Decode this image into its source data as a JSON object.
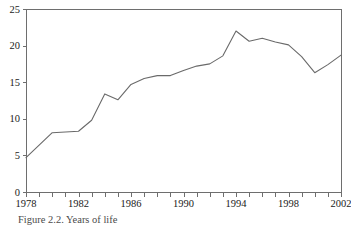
{
  "figure": {
    "caption": "Figure 2.2.  Years of life",
    "background_color": "#ffffff",
    "line_color": "#6a6a6a",
    "axis_color": "#6e6e6e",
    "text_color": "#1a1a1a"
  },
  "chart_data": {
    "type": "line",
    "title": "",
    "subtitle": "",
    "xlabel": "",
    "ylabel": "",
    "xlim": [
      1978,
      2002
    ],
    "ylim": [
      0,
      25
    ],
    "grid": false,
    "legend": false,
    "legend_position": "none",
    "x_tick_labels": [
      "1978",
      "1982",
      "1986",
      "1990",
      "1994",
      "1998",
      "2002"
    ],
    "x_tick_label_values": [
      1978,
      1982,
      1986,
      1990,
      1994,
      1998,
      2002
    ],
    "x_minor_ticks": [
      1978,
      1979,
      1980,
      1981,
      1982,
      1983,
      1984,
      1985,
      1986,
      1987,
      1988,
      1989,
      1990,
      1991,
      1992,
      1993,
      1994,
      1995,
      1996,
      1997,
      1998,
      1999,
      2000,
      2001,
      2002
    ],
    "y_tick_labels": [
      "0",
      "5",
      "10",
      "15",
      "20",
      "25"
    ],
    "y_tick_label_values": [
      0,
      5,
      10,
      15,
      20,
      25
    ],
    "x": [
      1978,
      1979,
      1980,
      1981,
      1982,
      1983,
      1984,
      1985,
      1986,
      1987,
      1988,
      1989,
      1990,
      1991,
      1992,
      1993,
      1994,
      1995,
      1996,
      1997,
      1998,
      1999,
      2000,
      2001,
      2002
    ],
    "values": [
      4.7,
      6.4,
      8.1,
      8.2,
      8.3,
      9.8,
      13.4,
      12.6,
      14.7,
      15.5,
      15.9,
      15.9,
      16.6,
      17.2,
      17.5,
      18.6,
      22.0,
      20.6,
      21.0,
      20.5,
      20.1,
      18.5,
      16.3,
      17.4,
      18.7
    ],
    "series": [
      {
        "name": "series-1",
        "color": "#6a6a6a",
        "values": [
          4.7,
          6.4,
          8.1,
          8.2,
          8.3,
          9.8,
          13.4,
          12.6,
          14.7,
          15.5,
          15.9,
          15.9,
          16.6,
          17.2,
          17.5,
          18.6,
          22.0,
          20.6,
          21.0,
          20.5,
          20.1,
          18.5,
          16.3,
          17.4,
          18.7
        ]
      }
    ]
  },
  "geometry": {
    "plot_left": 26,
    "plot_right": 341,
    "plot_top": 9,
    "plot_bottom": 192
  }
}
